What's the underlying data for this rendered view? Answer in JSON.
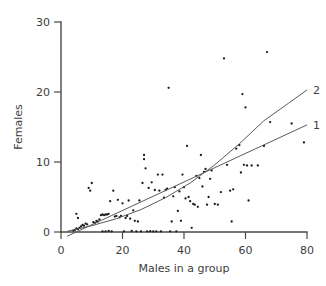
{
  "chart_data": {
    "type": "scatter",
    "title": "",
    "xlabel": "Males in a group",
    "ylabel": "Females",
    "xlim": [
      0,
      80
    ],
    "ylim": [
      0,
      30
    ],
    "xticks": [
      0,
      20,
      40,
      60,
      80
    ],
    "yticks": [
      0,
      10,
      20,
      30
    ],
    "xtick_labels": [
      "0",
      "20",
      "40",
      "60",
      "80"
    ],
    "ytick_labels": [
      "0",
      "10",
      "20",
      "30"
    ],
    "grid": false,
    "legend": "none",
    "points": [
      [
        4.0,
        0.2
      ],
      [
        4.5,
        0.3
      ],
      [
        5.0,
        0.5
      ],
      [
        5.5,
        0.4
      ],
      [
        6.0,
        0.6
      ],
      [
        5.0,
        2.6
      ],
      [
        5.5,
        2.0
      ],
      [
        6.5,
        0.8
      ],
      [
        7.0,
        1.0
      ],
      [
        7.5,
        0.9
      ],
      [
        8.0,
        1.2
      ],
      [
        8.5,
        1.1
      ],
      [
        9.0,
        6.3
      ],
      [
        9.5,
        5.9
      ],
      [
        10.0,
        7.0
      ],
      [
        10.5,
        1.4
      ],
      [
        11.0,
        1.3
      ],
      [
        11.5,
        1.6
      ],
      [
        12.0,
        1.5
      ],
      [
        12.5,
        1.8
      ],
      [
        13.0,
        2.4
      ],
      [
        13.5,
        2.5
      ],
      [
        14.0,
        2.4
      ],
      [
        14.5,
        2.5
      ],
      [
        15.0,
        2.5
      ],
      [
        15.5,
        2.6
      ],
      [
        13.5,
        0.1
      ],
      [
        14.5,
        0.1
      ],
      [
        15.5,
        0.15
      ],
      [
        16.5,
        0.1
      ],
      [
        16.0,
        4.4
      ],
      [
        17.0,
        5.9
      ],
      [
        17.5,
        2.2
      ],
      [
        18.0,
        2.3
      ],
      [
        18.5,
        4.6
      ],
      [
        19.0,
        2.1
      ],
      [
        19.5,
        2.3
      ],
      [
        20.0,
        4.1
      ],
      [
        20.5,
        0.1
      ],
      [
        21.0,
        2.0
      ],
      [
        21.5,
        2.3
      ],
      [
        22.0,
        4.5
      ],
      [
        22.5,
        1.9
      ],
      [
        23.0,
        0.15
      ],
      [
        23.5,
        3.1
      ],
      [
        24.0,
        1.6
      ],
      [
        24.5,
        0.1
      ],
      [
        25.0,
        1.5
      ],
      [
        25.5,
        4.5
      ],
      [
        26.0,
        0.1
      ],
      [
        26.5,
        7.0
      ],
      [
        27.0,
        10.4
      ],
      [
        27.5,
        9.1
      ],
      [
        27.0,
        11.0
      ],
      [
        28.0,
        0.1
      ],
      [
        28.5,
        6.3
      ],
      [
        29.0,
        0.12
      ],
      [
        29.5,
        7.1
      ],
      [
        30.0,
        0.1
      ],
      [
        30.5,
        6.0
      ],
      [
        31.0,
        0.1
      ],
      [
        31.5,
        8.2
      ],
      [
        32.0,
        5.9
      ],
      [
        32.5,
        0.1
      ],
      [
        33.0,
        8.2
      ],
      [
        33.5,
        4.9
      ],
      [
        34.0,
        6.0
      ],
      [
        34.5,
        6.2
      ],
      [
        35.0,
        20.6
      ],
      [
        35.5,
        0.1
      ],
      [
        36.0,
        1.5
      ],
      [
        36.5,
        5.1
      ],
      [
        37.0,
        6.4
      ],
      [
        37.5,
        0.1
      ],
      [
        38.0,
        3.0
      ],
      [
        38.5,
        5.8
      ],
      [
        39.0,
        1.6
      ],
      [
        39.5,
        8.2
      ],
      [
        40.0,
        6.4
      ],
      [
        40.5,
        4.8
      ],
      [
        41.0,
        12.3
      ],
      [
        41.5,
        5.0
      ],
      [
        42.0,
        4.4
      ],
      [
        42.5,
        0.6
      ],
      [
        43.0,
        4.0
      ],
      [
        43.5,
        3.9
      ],
      [
        44.0,
        8.0
      ],
      [
        44.5,
        3.6
      ],
      [
        45.0,
        7.7
      ],
      [
        45.5,
        11.0
      ],
      [
        46.0,
        6.5
      ],
      [
        46.5,
        8.6
      ],
      [
        47.0,
        9.0
      ],
      [
        47.5,
        3.9
      ],
      [
        48.0,
        5.0
      ],
      [
        48.5,
        7.6
      ],
      [
        49.0,
        8.8
      ],
      [
        50.0,
        4.0
      ],
      [
        51.0,
        3.9
      ],
      [
        52.0,
        5.7
      ],
      [
        53.0,
        24.8
      ],
      [
        54.0,
        9.6
      ],
      [
        55.0,
        5.9
      ],
      [
        55.5,
        1.5
      ],
      [
        56.0,
        6.1
      ],
      [
        57.0,
        11.9
      ],
      [
        58.0,
        12.4
      ],
      [
        58.5,
        8.5
      ],
      [
        59.0,
        19.7
      ],
      [
        59.5,
        9.6
      ],
      [
        60.0,
        17.8
      ],
      [
        60.5,
        9.5
      ],
      [
        61.0,
        4.5
      ],
      [
        62.0,
        9.5
      ],
      [
        64.0,
        9.5
      ],
      [
        66.0,
        12.3
      ],
      [
        67.0,
        25.7
      ],
      [
        68.0,
        15.7
      ],
      [
        75.0,
        15.5
      ],
      [
        79.0,
        12.8
      ]
    ],
    "curves": [
      {
        "label": "1",
        "description": "linear regression line",
        "points": [
          [
            2.0,
            -0.6
          ],
          [
            80.0,
            15.3
          ]
        ]
      },
      {
        "label": "2",
        "description": "quadratic/exponential fit curve",
        "points": [
          [
            2.0,
            0.1
          ],
          [
            10.0,
            0.9
          ],
          [
            18.0,
            1.9
          ],
          [
            26.0,
            3.2
          ],
          [
            34.0,
            4.9
          ],
          [
            42.0,
            7.0
          ],
          [
            50.0,
            9.6
          ],
          [
            58.0,
            12.6
          ],
          [
            66.0,
            15.9
          ],
          [
            74.0,
            18.4
          ],
          [
            80.0,
            20.3
          ]
        ]
      }
    ]
  },
  "geometry": {
    "plot_left": 61,
    "plot_right": 307,
    "plot_top": 22,
    "plot_bottom": 232
  }
}
